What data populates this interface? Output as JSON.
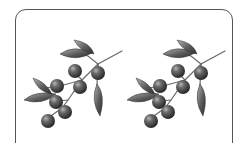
{
  "illustration": {
    "description": "Two identical grayscale olive branch illustrations inside a rounded frame",
    "branches": [
      {
        "id": "left",
        "offset_x": 0
      },
      {
        "id": "right",
        "offset_x": 103
      }
    ],
    "berry_count_per_branch": 7,
    "leaf_count_per_branch": 5,
    "colors": {
      "frame": "#555555",
      "berry_dark": "#2e2e2e",
      "berry_light": "#9a9a9a",
      "leaf_dark": "#3a3a3a",
      "leaf_light": "#a8a8a8",
      "stem": "#666666"
    }
  }
}
